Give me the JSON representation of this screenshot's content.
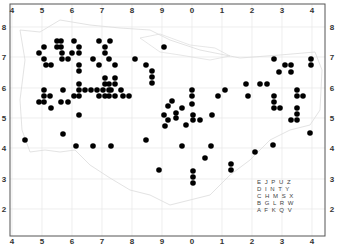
{
  "map": {
    "title": "",
    "frame": {
      "x0": 10,
      "y0": 4,
      "x1": 325,
      "y1": 236
    },
    "colors": {
      "grid": "#e6e6e6",
      "coast": "#d9d9d9",
      "frame": "#555555",
      "dot": "#000000"
    },
    "x_ticks": [
      {
        "label": "4",
        "px": 12
      },
      {
        "label": "5",
        "px": 42
      },
      {
        "label": "6",
        "px": 72
      },
      {
        "label": "7",
        "px": 102
      },
      {
        "label": "8",
        "px": 132
      },
      {
        "label": "9",
        "px": 162
      },
      {
        "label": "0",
        "px": 192
      },
      {
        "label": "1",
        "px": 222
      },
      {
        "label": "2",
        "px": 252
      },
      {
        "label": "3",
        "px": 282
      },
      {
        "label": "4",
        "px": 312
      }
    ],
    "y_ticks": [
      {
        "label": "8",
        "px": 27
      },
      {
        "label": "7",
        "px": 57
      },
      {
        "label": "6",
        "px": 88
      },
      {
        "label": "5",
        "px": 118
      },
      {
        "label": "4",
        "px": 148
      },
      {
        "label": "3",
        "px": 179
      },
      {
        "label": "2",
        "px": 209
      }
    ],
    "legend_rows": [
      "E J P U Z",
      "D I N T Y",
      "C H M S X",
      "B G L R W",
      "A F K Q V"
    ],
    "dots": [
      [
        39,
        53
      ],
      [
        44,
        47
      ],
      [
        44,
        59
      ],
      [
        46,
        65
      ],
      [
        51,
        65
      ],
      [
        57,
        41
      ],
      [
        57,
        47
      ],
      [
        61,
        41
      ],
      [
        61,
        47
      ],
      [
        62,
        53
      ],
      [
        62,
        59
      ],
      [
        68,
        59
      ],
      [
        74,
        41
      ],
      [
        72,
        53
      ],
      [
        79,
        47
      ],
      [
        79,
        53
      ],
      [
        79,
        65
      ],
      [
        79,
        71
      ],
      [
        93,
        59
      ],
      [
        99,
        41
      ],
      [
        99,
        65
      ],
      [
        105,
        47
      ],
      [
        105,
        53
      ],
      [
        110,
        41
      ],
      [
        109,
        59
      ],
      [
        115,
        65
      ],
      [
        135,
        59
      ],
      [
        146,
        65
      ],
      [
        152,
        71
      ],
      [
        152,
        77
      ],
      [
        152,
        83
      ],
      [
        164,
        47
      ],
      [
        44,
        90
      ],
      [
        44,
        96
      ],
      [
        39,
        102
      ],
      [
        44,
        102
      ],
      [
        50,
        96
      ],
      [
        51,
        108
      ],
      [
        63,
        90
      ],
      [
        61,
        102
      ],
      [
        68,
        102
      ],
      [
        74,
        96
      ],
      [
        79,
        84
      ],
      [
        79,
        90
      ],
      [
        79,
        96
      ],
      [
        85,
        90
      ],
      [
        91,
        90
      ],
      [
        97,
        90
      ],
      [
        99,
        96
      ],
      [
        103,
        90
      ],
      [
        105,
        84
      ],
      [
        105,
        96
      ],
      [
        109,
        84
      ],
      [
        109,
        90
      ],
      [
        109,
        96
      ],
      [
        111,
        90
      ],
      [
        115,
        84
      ],
      [
        115,
        96
      ],
      [
        121,
        90
      ],
      [
        123,
        96
      ],
      [
        129,
        96
      ],
      [
        105,
        78
      ],
      [
        115,
        78
      ],
      [
        79,
        115
      ],
      [
        164,
        115
      ],
      [
        168,
        106
      ],
      [
        172,
        101
      ],
      [
        176,
        113
      ],
      [
        176,
        118
      ],
      [
        168,
        120
      ],
      [
        182,
        108
      ],
      [
        186,
        125
      ],
      [
        192,
        90
      ],
      [
        192,
        96
      ],
      [
        192,
        104
      ],
      [
        193,
        115
      ],
      [
        193,
        120
      ],
      [
        200,
        120
      ],
      [
        212,
        115
      ],
      [
        218,
        96
      ],
      [
        225,
        90
      ],
      [
        246,
        84
      ],
      [
        248,
        96
      ],
      [
        260,
        84
      ],
      [
        267,
        84
      ],
      [
        274,
        59
      ],
      [
        274,
        96
      ],
      [
        274,
        102
      ],
      [
        274,
        108
      ],
      [
        279,
        72
      ],
      [
        280,
        108
      ],
      [
        285,
        65
      ],
      [
        291,
        65
      ],
      [
        291,
        72
      ],
      [
        297,
        90
      ],
      [
        297,
        96
      ],
      [
        303,
        96
      ],
      [
        311,
        59
      ],
      [
        311,
        65
      ],
      [
        297,
        108
      ],
      [
        297,
        114
      ],
      [
        297,
        120
      ],
      [
        310,
        133
      ],
      [
        291,
        120
      ],
      [
        25,
        140
      ],
      [
        63,
        134
      ],
      [
        76,
        146
      ],
      [
        93,
        146
      ],
      [
        111,
        146
      ],
      [
        146,
        140
      ],
      [
        159,
        170
      ],
      [
        165,
        126
      ],
      [
        182,
        146
      ],
      [
        193,
        171
      ],
      [
        193,
        177
      ],
      [
        193,
        183
      ],
      [
        205,
        158
      ],
      [
        211,
        146
      ],
      [
        231,
        164
      ],
      [
        231,
        170
      ],
      [
        255,
        152
      ],
      [
        273,
        145
      ]
    ]
  }
}
